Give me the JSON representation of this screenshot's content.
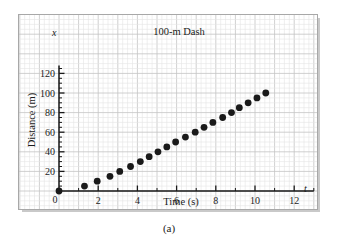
{
  "figure": {
    "caption": "(a)",
    "title": "100-m Dash"
  },
  "chart_data": {
    "type": "scatter",
    "title": "100-m Dash",
    "xlabel": "Time (s)",
    "ylabel": "Distance (m)",
    "x_axis_symbol": "t",
    "y_axis_symbol": "x",
    "xlim": [
      0,
      13
    ],
    "ylim": [
      0,
      128
    ],
    "x_major_ticks": [
      0,
      2,
      4,
      6,
      8,
      10,
      12
    ],
    "x_minor_tick_step": 1,
    "y_major_ticks": [
      20,
      40,
      60,
      80,
      100,
      120
    ],
    "y_minor_tick_step": 5,
    "x_tick_labels": [
      "0",
      "2",
      "4",
      "6",
      "8",
      "10",
      "12"
    ],
    "y_tick_labels": [
      "20",
      "40",
      "60",
      "80",
      "100",
      "120"
    ],
    "grid": true,
    "grid_color": "#cfcfcf",
    "marker_color": "#1a1a1a",
    "marker_size": 3.4,
    "legend": null,
    "x": [
      0.0,
      1.3,
      1.95,
      2.6,
      3.1,
      3.65,
      4.15,
      4.6,
      5.05,
      5.5,
      5.95,
      6.45,
      6.95,
      7.4,
      7.85,
      8.35,
      8.8,
      9.2,
      9.65,
      10.1,
      10.55
    ],
    "y": [
      0,
      5,
      10,
      15,
      20,
      25,
      30,
      35,
      40,
      45,
      50,
      55,
      60,
      65,
      70,
      75,
      80,
      85,
      90,
      95,
      100
    ],
    "points": [
      [
        0.0,
        0
      ],
      [
        1.3,
        5
      ],
      [
        1.95,
        10
      ],
      [
        2.6,
        15
      ],
      [
        3.1,
        20
      ],
      [
        3.65,
        25
      ],
      [
        4.15,
        30
      ],
      [
        4.6,
        35
      ],
      [
        5.05,
        40
      ],
      [
        5.5,
        45
      ],
      [
        5.95,
        50
      ],
      [
        6.45,
        55
      ],
      [
        6.95,
        60
      ],
      [
        7.4,
        65
      ],
      [
        7.85,
        70
      ],
      [
        8.35,
        75
      ],
      [
        8.8,
        80
      ],
      [
        9.2,
        85
      ],
      [
        9.65,
        90
      ],
      [
        10.1,
        95
      ],
      [
        10.55,
        100
      ]
    ]
  }
}
